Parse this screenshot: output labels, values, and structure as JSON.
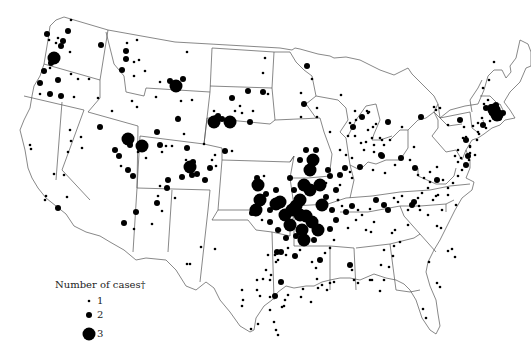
{
  "map": {
    "title": "",
    "region": "Contiguous United States",
    "dot_color": "#000000",
    "border_color": "#555555",
    "background": "#ffffff"
  },
  "legend": {
    "title": "Number of cases†",
    "items": [
      {
        "label": "1",
        "radius": 1.3
      },
      {
        "label": "2",
        "radius": 3
      },
      {
        "label": "3",
        "radius": 6.5
      }
    ]
  },
  "dots": [
    [
      47,
      34,
      2
    ],
    [
      63,
      41,
      2
    ],
    [
      61,
      46,
      2
    ],
    [
      56,
      43,
      1
    ],
    [
      58,
      38,
      1
    ],
    [
      68,
      31,
      2
    ],
    [
      49,
      40,
      1
    ],
    [
      71,
      20,
      1
    ],
    [
      101,
      45,
      2
    ],
    [
      70,
      52,
      1
    ],
    [
      54,
      58,
      3
    ],
    [
      51,
      63,
      2
    ],
    [
      50,
      68,
      1
    ],
    [
      44,
      71,
      2
    ],
    [
      40,
      83,
      2
    ],
    [
      58,
      80,
      2
    ],
    [
      71,
      74,
      1
    ],
    [
      78,
      79,
      1
    ],
    [
      89,
      79,
      1
    ],
    [
      40,
      94,
      1
    ],
    [
      50,
      94,
      2
    ],
    [
      61,
      96,
      2
    ],
    [
      74,
      97,
      1
    ],
    [
      127,
      43,
      1
    ],
    [
      137,
      40,
      1
    ],
    [
      126,
      51,
      2
    ],
    [
      126,
      59,
      2
    ],
    [
      134,
      62,
      1
    ],
    [
      139,
      60,
      1
    ],
    [
      122,
      70,
      2
    ],
    [
      134,
      76,
      1
    ],
    [
      145,
      71,
      1
    ],
    [
      160,
      82,
      1
    ],
    [
      170,
      81,
      2
    ],
    [
      176,
      86,
      3
    ],
    [
      183,
      79,
      2
    ],
    [
      187,
      52,
      1
    ],
    [
      132,
      101,
      1
    ],
    [
      137,
      107,
      1
    ],
    [
      98,
      98,
      1
    ],
    [
      112,
      111,
      1
    ],
    [
      156,
      97,
      1
    ],
    [
      178,
      117,
      1
    ],
    [
      178,
      119,
      2
    ],
    [
      157,
      132,
      2
    ],
    [
      192,
      100,
      1
    ],
    [
      181,
      101,
      1
    ],
    [
      184,
      134,
      1
    ],
    [
      214,
      122,
      3
    ],
    [
      216,
      118,
      2
    ],
    [
      218,
      116,
      2
    ],
    [
      222,
      119,
      2
    ],
    [
      230,
      122,
      3
    ],
    [
      214,
      111,
      1
    ],
    [
      235,
      111,
      1
    ],
    [
      240,
      106,
      1
    ],
    [
      242,
      113,
      1
    ],
    [
      232,
      98,
      2
    ],
    [
      250,
      122,
      2
    ],
    [
      253,
      111,
      1
    ],
    [
      248,
      91,
      2
    ],
    [
      263,
      92,
      2
    ],
    [
      268,
      94,
      1
    ],
    [
      265,
      58,
      1
    ],
    [
      263,
      73,
      1
    ],
    [
      70,
      130,
      1
    ],
    [
      81,
      137,
      1
    ],
    [
      71,
      141,
      1
    ],
    [
      100,
      127,
      2
    ],
    [
      82,
      148,
      1
    ],
    [
      68,
      152,
      1
    ],
    [
      64,
      175,
      1
    ],
    [
      58,
      208,
      2
    ],
    [
      67,
      197,
      1
    ],
    [
      46,
      196,
      1
    ],
    [
      45,
      200,
      1
    ],
    [
      54,
      174,
      1
    ],
    [
      30,
      145,
      1
    ],
    [
      31,
      149,
      1
    ],
    [
      128,
      139,
      3
    ],
    [
      130,
      145,
      2
    ],
    [
      142,
      146,
      3
    ],
    [
      119,
      156,
      2
    ],
    [
      115,
      150,
      2
    ],
    [
      128,
      170,
      2
    ],
    [
      138,
      152,
      1
    ],
    [
      121,
      166,
      1
    ],
    [
      133,
      176,
      2
    ],
    [
      146,
      158,
      1
    ],
    [
      160,
      145,
      2
    ],
    [
      166,
      146,
      1
    ],
    [
      172,
      146,
      1
    ],
    [
      162,
      152,
      1
    ],
    [
      187,
      148,
      2
    ],
    [
      193,
      162,
      2
    ],
    [
      190,
      167,
      3
    ],
    [
      192,
      175,
      2
    ],
    [
      186,
      160,
      1
    ],
    [
      168,
      180,
      2
    ],
    [
      167,
      188,
      2
    ],
    [
      160,
      186,
      1
    ],
    [
      175,
      198,
      1
    ],
    [
      158,
      196,
      1
    ],
    [
      182,
      177,
      2
    ],
    [
      157,
      203,
      2
    ],
    [
      162,
      211,
      1
    ],
    [
      136,
      212,
      2
    ],
    [
      152,
      224,
      1
    ],
    [
      134,
      229,
      1
    ],
    [
      124,
      223,
      2
    ],
    [
      197,
      174,
      2
    ],
    [
      205,
      180,
      2
    ],
    [
      210,
      168,
      2
    ],
    [
      212,
      160,
      1
    ],
    [
      216,
      166,
      1
    ],
    [
      225,
      151,
      2
    ],
    [
      232,
      151,
      1
    ],
    [
      215,
      155,
      1
    ],
    [
      204,
      144,
      1
    ],
    [
      258,
      185,
      3
    ],
    [
      260,
      200,
      3
    ],
    [
      256,
      210,
      3
    ],
    [
      266,
      194,
      2
    ],
    [
      262,
      220,
      1
    ],
    [
      252,
      213,
      2
    ],
    [
      254,
      183,
      1
    ],
    [
      257,
      178,
      2
    ],
    [
      264,
      176,
      1
    ],
    [
      276,
      190,
      2
    ],
    [
      270,
      210,
      2
    ],
    [
      280,
      230,
      1
    ],
    [
      277,
      252,
      2
    ],
    [
      281,
      252,
      2
    ],
    [
      271,
      275,
      1
    ],
    [
      282,
      307,
      1
    ],
    [
      284,
      306,
      1
    ],
    [
      285,
      300,
      1
    ],
    [
      270,
      297,
      1
    ],
    [
      290,
      178,
      2
    ],
    [
      294,
      190,
      2
    ],
    [
      300,
      215,
      3
    ],
    [
      300,
      200,
      3
    ],
    [
      304,
      185,
      3
    ],
    [
      310,
      190,
      3
    ],
    [
      296,
      206,
      3
    ],
    [
      306,
      216,
      3
    ],
    [
      312,
      222,
      3
    ],
    [
      302,
      230,
      3
    ],
    [
      290,
      225,
      3
    ],
    [
      292,
      210,
      3
    ],
    [
      285,
      215,
      3
    ],
    [
      280,
      202,
      3
    ],
    [
      276,
      204,
      3
    ],
    [
      310,
      170,
      3
    ],
    [
      313,
      160,
      3
    ],
    [
      300,
      160,
      2
    ],
    [
      306,
      150,
      2
    ],
    [
      316,
      150,
      2
    ],
    [
      320,
      185,
      3
    ],
    [
      322,
      205,
      3
    ],
    [
      318,
      230,
      3
    ],
    [
      314,
      240,
      2
    ],
    [
      304,
      240,
      3
    ],
    [
      296,
      236,
      2
    ],
    [
      286,
      238,
      2
    ],
    [
      278,
      230,
      2
    ],
    [
      270,
      222,
      2
    ],
    [
      320,
      260,
      2
    ],
    [
      316,
      268,
      1
    ],
    [
      328,
      170,
      2
    ],
    [
      326,
      197,
      2
    ],
    [
      332,
      210,
      2
    ],
    [
      336,
      220,
      2
    ],
    [
      330,
      229,
      2
    ],
    [
      334,
      240,
      1
    ],
    [
      330,
      248,
      1
    ],
    [
      325,
      253,
      1
    ],
    [
      300,
      250,
      1
    ],
    [
      295,
      256,
      2
    ],
    [
      288,
      248,
      1
    ],
    [
      312,
      262,
      1
    ],
    [
      320,
      185,
      2
    ],
    [
      326,
      183,
      1
    ],
    [
      330,
      176,
      2
    ],
    [
      340,
      175,
      2
    ],
    [
      345,
      168,
      2
    ],
    [
      350,
      172,
      1
    ],
    [
      352,
      178,
      1
    ],
    [
      340,
      185,
      1
    ],
    [
      336,
      190,
      2
    ],
    [
      338,
      200,
      1
    ],
    [
      342,
      206,
      1
    ],
    [
      346,
      212,
      2
    ],
    [
      352,
      206,
      2
    ],
    [
      358,
      210,
      1
    ],
    [
      362,
      215,
      1
    ],
    [
      370,
      209,
      1
    ],
    [
      376,
      200,
      2
    ],
    [
      384,
      205,
      2
    ],
    [
      388,
      210,
      2
    ],
    [
      394,
      198,
      1
    ],
    [
      398,
      202,
      1
    ],
    [
      402,
      196,
      1
    ],
    [
      408,
      210,
      1
    ],
    [
      412,
      205,
      2
    ],
    [
      414,
      202,
      2
    ],
    [
      418,
      198,
      1
    ],
    [
      422,
      193,
      1
    ],
    [
      428,
      188,
      1
    ],
    [
      438,
      195,
      1
    ],
    [
      448,
      195,
      1
    ],
    [
      442,
      210,
      1
    ],
    [
      456,
      205,
      1
    ],
    [
      340,
      150,
      1
    ],
    [
      346,
      155,
      1
    ],
    [
      352,
      158,
      1
    ],
    [
      364,
      150,
      1
    ],
    [
      374,
      152,
      1
    ],
    [
      382,
      156,
      2
    ],
    [
      384,
      145,
      1
    ],
    [
      360,
      167,
      2
    ],
    [
      373,
      170,
      1
    ],
    [
      385,
      173,
      1
    ],
    [
      395,
      165,
      1
    ],
    [
      401,
      158,
      2
    ],
    [
      414,
      147,
      1
    ],
    [
      410,
      160,
      1
    ],
    [
      415,
      168,
      2
    ],
    [
      418,
      175,
      1
    ],
    [
      430,
      172,
      1
    ],
    [
      437,
      167,
      1
    ],
    [
      424,
      178,
      1
    ],
    [
      430,
      182,
      1
    ],
    [
      437,
      180,
      2
    ],
    [
      443,
      180,
      1
    ],
    [
      448,
      188,
      1
    ],
    [
      453,
      183,
      1
    ],
    [
      458,
      176,
      1
    ],
    [
      462,
      170,
      1
    ],
    [
      466,
      165,
      2
    ],
    [
      468,
      156,
      2
    ],
    [
      458,
      162,
      1
    ],
    [
      307,
      66,
      2
    ],
    [
      312,
      79,
      1
    ],
    [
      301,
      93,
      1
    ],
    [
      301,
      117,
      1
    ],
    [
      304,
      104,
      2
    ],
    [
      317,
      117,
      1
    ],
    [
      341,
      95,
      1
    ],
    [
      355,
      111,
      1
    ],
    [
      356,
      120,
      1
    ],
    [
      362,
      117,
      2
    ],
    [
      350,
      123,
      1
    ],
    [
      353,
      127,
      2
    ],
    [
      348,
      136,
      1
    ],
    [
      355,
      136,
      1
    ],
    [
      361,
      143,
      1
    ],
    [
      374,
      145,
      1
    ],
    [
      381,
      155,
      2
    ],
    [
      368,
      130,
      1
    ],
    [
      372,
      138,
      1
    ],
    [
      366,
      142,
      1
    ],
    [
      317,
      108,
      1
    ],
    [
      368,
      113,
      1
    ],
    [
      373,
      127,
      1
    ],
    [
      376,
      124,
      1
    ],
    [
      380,
      138,
      1
    ],
    [
      330,
      132,
      1
    ],
    [
      369,
      112,
      1
    ],
    [
      367,
      111,
      1
    ],
    [
      388,
      122,
      2
    ],
    [
      382,
      140,
      1
    ],
    [
      390,
      140,
      1
    ],
    [
      402,
      127,
      1
    ],
    [
      421,
      117,
      2
    ],
    [
      434,
      107,
      1
    ],
    [
      436,
      110,
      1
    ],
    [
      440,
      108,
      1
    ],
    [
      448,
      125,
      1
    ],
    [
      460,
      120,
      2
    ],
    [
      464,
      127,
      1
    ],
    [
      463,
      138,
      1
    ],
    [
      466,
      140,
      2
    ],
    [
      470,
      146,
      1
    ],
    [
      469,
      160,
      1
    ],
    [
      458,
      150,
      1
    ],
    [
      455,
      156,
      1
    ],
    [
      461,
      158,
      1
    ],
    [
      470,
      153,
      1
    ],
    [
      482,
      118,
      1
    ],
    [
      490,
      121,
      1
    ],
    [
      486,
      108,
      2
    ],
    [
      491,
      107,
      2
    ],
    [
      494,
      110,
      3
    ],
    [
      497,
      115,
      3
    ],
    [
      492,
      113,
      2
    ],
    [
      496,
      105,
      2
    ],
    [
      499,
      118,
      2
    ],
    [
      503,
      113,
      2
    ],
    [
      484,
      104,
      1
    ],
    [
      488,
      100,
      1
    ],
    [
      483,
      88,
      1
    ],
    [
      489,
      80,
      1
    ],
    [
      494,
      62,
      1
    ],
    [
      483,
      125,
      2
    ],
    [
      486,
      128,
      1
    ],
    [
      478,
      132,
      1
    ],
    [
      478,
      123,
      1
    ],
    [
      479,
      134,
      1
    ],
    [
      475,
      155,
      1
    ],
    [
      470,
      147,
      1
    ],
    [
      477,
      140,
      1
    ],
    [
      473,
      126,
      1
    ],
    [
      466,
      137,
      1
    ],
    [
      338,
      200,
      1
    ],
    [
      348,
      228,
      1
    ],
    [
      356,
      220,
      1
    ],
    [
      366,
      230,
      1
    ],
    [
      371,
      232,
      1
    ],
    [
      374,
      222,
      1
    ],
    [
      392,
      233,
      1
    ],
    [
      394,
      246,
      1
    ],
    [
      395,
      230,
      1
    ],
    [
      400,
      242,
      1
    ],
    [
      408,
      225,
      1
    ],
    [
      419,
      206,
      1
    ],
    [
      420,
      210,
      1
    ],
    [
      433,
      200,
      1
    ],
    [
      428,
      215,
      1
    ],
    [
      436,
      196,
      1
    ],
    [
      437,
      226,
      1
    ],
    [
      441,
      228,
      1
    ],
    [
      448,
      251,
      1
    ],
    [
      452,
      249,
      1
    ],
    [
      455,
      257,
      1
    ],
    [
      429,
      262,
      1
    ],
    [
      437,
      283,
      1
    ],
    [
      440,
      287,
      1
    ],
    [
      423,
      309,
      1
    ],
    [
      426,
      318,
      1
    ],
    [
      350,
      265,
      2
    ],
    [
      352,
      270,
      1
    ],
    [
      358,
      283,
      1
    ],
    [
      370,
      280,
      1
    ],
    [
      372,
      280,
      1
    ],
    [
      384,
      280,
      1
    ],
    [
      389,
      267,
      1
    ],
    [
      393,
      256,
      1
    ],
    [
      384,
      250,
      1
    ],
    [
      381,
      265,
      1
    ],
    [
      380,
      291,
      1
    ],
    [
      354,
      280,
      1
    ],
    [
      330,
      283,
      1
    ],
    [
      334,
      282,
      1
    ],
    [
      318,
      288,
      1
    ],
    [
      322,
      285,
      1
    ],
    [
      311,
      302,
      1
    ],
    [
      275,
      296,
      2
    ],
    [
      275,
      255,
      1
    ],
    [
      286,
      255,
      1
    ],
    [
      281,
      282,
      2
    ],
    [
      278,
      260,
      1
    ],
    [
      270,
      280,
      1
    ],
    [
      257,
      280,
      1
    ],
    [
      257,
      290,
      1
    ],
    [
      263,
      279,
      1
    ],
    [
      278,
      335,
      1
    ],
    [
      276,
      330,
      1
    ],
    [
      288,
      295,
      1
    ],
    [
      301,
      297,
      1
    ],
    [
      303,
      289,
      1
    ],
    [
      317,
      279,
      1
    ],
    [
      327,
      290,
      1
    ],
    [
      187,
      264,
      1
    ],
    [
      190,
      264,
      1
    ],
    [
      215,
      249,
      1
    ],
    [
      201,
      247,
      1
    ],
    [
      242,
      290,
      1
    ],
    [
      243,
      300,
      1
    ],
    [
      242,
      306,
      1
    ],
    [
      260,
      296,
      1
    ],
    [
      270,
      310,
      1
    ],
    [
      274,
      322,
      1
    ],
    [
      258,
      324,
      1
    ],
    [
      251,
      329,
      1
    ],
    [
      276,
      262,
      1
    ],
    [
      266,
      270,
      1
    ],
    [
      268,
      255,
      1
    ]
  ],
  "states": []
}
